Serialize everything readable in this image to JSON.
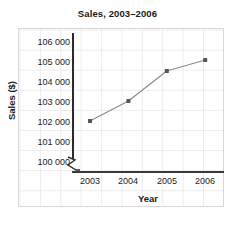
{
  "chart_data": {
    "type": "line",
    "title": "Sales, 2003–2006",
    "xlabel": "Year",
    "ylabel": "Sales ($)",
    "categories": [
      "2003",
      "2004",
      "2005",
      "2006"
    ],
    "x": [
      2003,
      2004,
      2005,
      2006
    ],
    "values": [
      102000,
      103000,
      104500,
      105050
    ],
    "series": [
      {
        "name": "Sales",
        "values": [
          102000,
          103000,
          104500,
          105050
        ]
      }
    ],
    "ytick_labels": [
      "106 000",
      "105 000",
      "104 000",
      "103 000",
      "102 000",
      "101 000",
      "100 000"
    ],
    "ytick_values": [
      106000,
      105000,
      104000,
      103000,
      102000,
      101000,
      100000
    ],
    "xtick_labels": [
      "2003",
      "2004",
      "2005",
      "2006"
    ],
    "ylim": [
      100000,
      106000
    ],
    "axis_break": true,
    "grid": true,
    "legend": null,
    "legend_position": "none",
    "colors": {
      "line": "#8c8c8c",
      "marker": "#555555",
      "axis": "#2b2b2b",
      "grid": "#ececec",
      "panel_border": "#d8d8d8",
      "text": "#1a1a1a",
      "background": "#ffffff"
    }
  }
}
